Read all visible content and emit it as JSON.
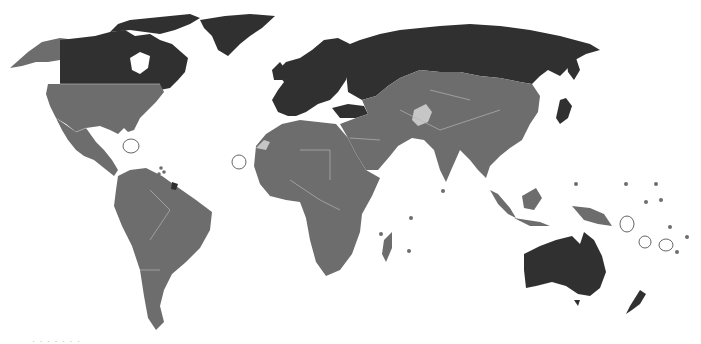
{
  "map": {
    "type": "world-choropleth",
    "colors": {
      "dark": "#303030",
      "medium": "#6d6d6d",
      "light": "#c6c6c6",
      "border": "#b4b4b4",
      "background": "#ffffff"
    },
    "regions": {
      "dark": [
        "Canada",
        "Greenland",
        "Europe",
        "Russia",
        "Turkey",
        "Australia",
        "New Zealand",
        "Japan",
        "French Guiana"
      ],
      "medium": [
        "Alaska",
        "United States",
        "Mexico",
        "Central America",
        "South America",
        "Africa",
        "Middle East",
        "Central Asia",
        "China",
        "Mongolia",
        "South Asia",
        "Southeast Asia",
        "Papua New Guinea"
      ],
      "light": [
        "Afghanistan",
        "Western Sahara"
      ]
    }
  },
  "caption": "· · ·  · · · ·"
}
